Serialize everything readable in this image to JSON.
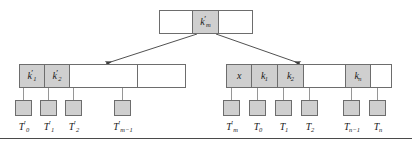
{
  "figure": {
    "colors": {
      "shaded_cell": "#cfcfcf",
      "border": "#6d6d6d",
      "background": "#ffffff",
      "rule": "#4a4a4a"
    }
  },
  "root_node": {
    "name": "root-node",
    "cells": [
      {
        "label": "",
        "shaded": false
      },
      {
        "base": "k",
        "sub": "m",
        "prime": "′",
        "shaded": true
      },
      {
        "label": "",
        "shaded": false
      }
    ]
  },
  "left_node": {
    "name": "left-child-node",
    "cells": [
      {
        "base": "k",
        "sub": "1",
        "prime": "′",
        "shaded": true
      },
      {
        "base": "k",
        "sub": "2",
        "prime": "′",
        "shaded": true
      },
      {
        "label": "",
        "shaded": false
      },
      {
        "label": "",
        "shaded": false
      }
    ]
  },
  "right_node": {
    "name": "right-child-node",
    "cells": [
      {
        "base": "x",
        "sub": "",
        "prime": "",
        "shaded": true
      },
      {
        "base": "k",
        "sub": "1",
        "prime": "",
        "shaded": true
      },
      {
        "base": "k",
        "sub": "2",
        "prime": "",
        "shaded": true
      },
      {
        "label": "",
        "shaded": false
      },
      {
        "base": "k",
        "sub": "n",
        "prime": "",
        "shaded": true
      },
      {
        "label": "",
        "shaded": false
      }
    ]
  },
  "left_leaves": [
    {
      "base": "T",
      "sub": "0",
      "prime": "′"
    },
    {
      "base": "T",
      "sub": "1",
      "prime": "′"
    },
    {
      "base": "T",
      "sub": "2",
      "prime": "′"
    },
    {
      "base": "T",
      "sub": "m−1",
      "prime": "′"
    }
  ],
  "right_leaves": [
    {
      "base": "T",
      "sub": "m",
      "prime": "′"
    },
    {
      "base": "T",
      "sub": "0",
      "prime": ""
    },
    {
      "base": "T",
      "sub": "1",
      "prime": ""
    },
    {
      "base": "T",
      "sub": "2",
      "prime": ""
    },
    {
      "base": "T",
      "sub": "n−1",
      "prime": ""
    },
    {
      "base": "T",
      "sub": "n",
      "prime": ""
    }
  ]
}
